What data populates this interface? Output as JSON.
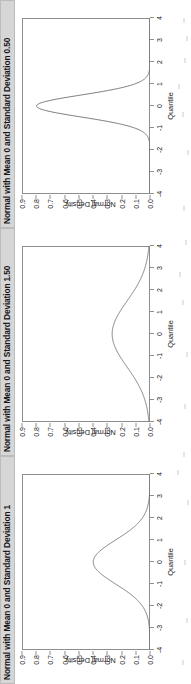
{
  "figure": {
    "orientation": "rotated-90-ccw",
    "panel_count": 3,
    "axis_color": "#8e8e8e",
    "curve_color": "#6f6f6f",
    "titlebar_bg": "#d6d6d6",
    "background": "#ffffff"
  },
  "axes": {
    "xlabel": "Quantile",
    "ylabel": "Normal Density",
    "xticks": [
      "-4",
      "-3",
      "-2",
      "-1",
      "0",
      "1",
      "2",
      "3",
      "4"
    ],
    "xtick_values": [
      -4,
      -3,
      -2,
      -1,
      0,
      1,
      2,
      3,
      4
    ],
    "yticks": [
      "0.9",
      "0.8",
      "0.7",
      "0.6",
      "0.5",
      "0.4",
      "0.3",
      "0.2",
      "0.1",
      "0.0"
    ],
    "ytick_values": [
      0.9,
      0.8,
      0.7,
      0.6,
      0.5,
      0.4,
      0.3,
      0.2,
      0.1,
      0.0
    ],
    "xlim": [
      -4,
      4
    ],
    "ylim": [
      0,
      0.9
    ]
  },
  "panels": [
    {
      "title": "Normal with Mean 0 and Standard Deviation 0.50",
      "mean": 0,
      "sd": 0.5,
      "peak": 0.798
    },
    {
      "title": "Normal with Mean 0 and Standard Deviation 1.50",
      "mean": 0,
      "sd": 1.5,
      "peak": 0.266
    },
    {
      "title": "Normal with Mean 0 and Standard Deviation 1",
      "mean": 0,
      "sd": 1.0,
      "peak": 0.399
    }
  ],
  "chart_data": [
    {
      "type": "line",
      "title": "Normal with Mean 0 and Standard Deviation 0.50",
      "xlabel": "Quantile",
      "ylabel": "Normal Density",
      "xlim": [
        -4,
        4
      ],
      "ylim": [
        0,
        0.9
      ],
      "grid": false,
      "legend": "none",
      "series": [
        {
          "name": "Normal pdf (mean 0, sd 0.50)",
          "x": [
            -4,
            -3.5,
            -3,
            -2.5,
            -2,
            -1.75,
            -1.5,
            -1.25,
            -1,
            -0.75,
            -0.5,
            -0.25,
            0,
            0.25,
            0.5,
            0.75,
            1,
            1.25,
            1.5,
            1.75,
            2,
            2.5,
            3,
            3.5,
            4
          ],
          "values": [
            0.0,
            0.0,
            0.0,
            0.0,
            0.003,
            0.009,
            0.022,
            0.046,
            0.108,
            0.21,
            0.484,
            0.704,
            0.798,
            0.704,
            0.484,
            0.21,
            0.108,
            0.046,
            0.022,
            0.009,
            0.003,
            0.0,
            0.0,
            0.0,
            0.0
          ]
        }
      ]
    },
    {
      "type": "line",
      "title": "Normal with Mean 0 and Standard Deviation 1.50",
      "xlabel": "Quantile",
      "ylabel": "Normal Density",
      "xlim": [
        -4,
        4
      ],
      "ylim": [
        0,
        0.9
      ],
      "grid": false,
      "legend": "none",
      "series": [
        {
          "name": "Normal pdf (mean 0, sd 1.50)",
          "x": [
            -4,
            -3.5,
            -3,
            -2.5,
            -2,
            -1.5,
            -1,
            -0.5,
            0,
            0.5,
            1,
            1.5,
            2,
            2.5,
            3,
            3.5,
            4
          ],
          "values": [
            0.01,
            0.023,
            0.048,
            0.086,
            0.139,
            0.212,
            0.258,
            0.252,
            0.266,
            0.252,
            0.258,
            0.212,
            0.139,
            0.086,
            0.048,
            0.023,
            0.01
          ]
        }
      ]
    },
    {
      "type": "line",
      "title": "Normal with Mean 0 and Standard Deviation 1",
      "xlabel": "Quantile",
      "ylabel": "Normal Density",
      "xlim": [
        -4,
        4
      ],
      "ylim": [
        0,
        0.9
      ],
      "grid": false,
      "legend": "none",
      "series": [
        {
          "name": "Normal pdf (mean 0, sd 1)",
          "x": [
            -4,
            -3.5,
            -3,
            -2.5,
            -2,
            -1.5,
            -1,
            -0.5,
            0,
            0.5,
            1,
            1.5,
            2,
            2.5,
            3,
            3.5,
            4
          ],
          "values": [
            0.0,
            0.001,
            0.004,
            0.018,
            0.054,
            0.13,
            0.242,
            0.352,
            0.399,
            0.352,
            0.242,
            0.13,
            0.054,
            0.018,
            0.004,
            0.001,
            0.0
          ]
        }
      ]
    }
  ]
}
